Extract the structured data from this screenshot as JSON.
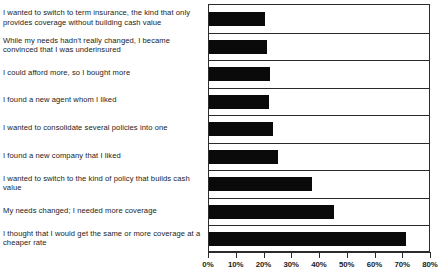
{
  "chart_data": {
    "type": "bar",
    "orientation": "horizontal",
    "title": "",
    "xlabel": "",
    "ylabel": "",
    "xlim": [
      0,
      80
    ],
    "xticks": [
      "0%",
      "10%",
      "20%",
      "30%",
      "40%",
      "50%",
      "60%",
      "70%",
      "80%"
    ],
    "xtick_values": [
      0,
      10,
      20,
      30,
      40,
      50,
      60,
      70,
      80
    ],
    "grid": true,
    "legend": "none",
    "bar_color": "#0a0a0a",
    "axis_color": "#2b2b2b",
    "categories": [
      "I wanted to switch to term insurance, the kind that only provides coverage without building cash value",
      "While my needs hadn't really changed, I became convinced that I was underinsured",
      "I could afford more, so I bought more",
      "I found a new agent whom I liked",
      "I wanted to consolidate several policies into one",
      "I found a new company that I liked",
      "I wanted to switch to the kind of policy that builds cash value",
      "My needs changed; I needed more coverage",
      "I thought that I would get the same or more coverage at a cheaper rate"
    ],
    "values": [
      20,
      21,
      22,
      21.5,
      23,
      25,
      37,
      45,
      71
    ]
  },
  "top_clip_text": ""
}
